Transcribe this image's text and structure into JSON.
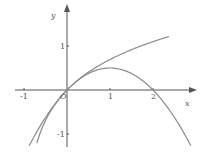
{
  "chart_data": {
    "type": "line",
    "title": "",
    "xlabel": "x",
    "ylabel": "y",
    "origin_label": "O",
    "xlim": [
      -1.2,
      2.95
    ],
    "ylim": [
      -1.3,
      1.9
    ],
    "x_ticks": [
      {
        "value": -1,
        "label": "-1"
      },
      {
        "value": 1,
        "label": "1"
      },
      {
        "value": 2,
        "label": "2"
      }
    ],
    "y_ticks": [
      {
        "value": 1,
        "label": "1"
      },
      {
        "value": -1,
        "label": "-1"
      }
    ],
    "grid": false,
    "series": [
      {
        "name": "y = ln(1+x)",
        "domain": [
          -0.7,
          2.37
        ],
        "color": "#8a8a8a"
      },
      {
        "name": "y = x - x^2/2",
        "domain": [
          -0.88,
          2.88
        ],
        "color": "#8a8a8a"
      }
    ]
  },
  "colors": {
    "axis": "#555555",
    "curve": "#8a8a8a"
  }
}
